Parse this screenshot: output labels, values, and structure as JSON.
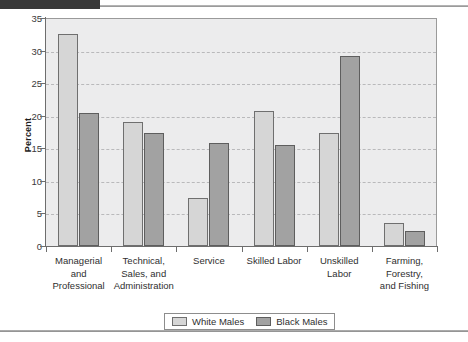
{
  "chart_data": {
    "type": "bar",
    "title": "",
    "xlabel": "",
    "ylabel": "Percent",
    "ylim": [
      0,
      35
    ],
    "yticks": [
      0,
      5,
      10,
      15,
      20,
      25,
      30,
      35
    ],
    "grid": true,
    "legend_position": "bottom",
    "categories": [
      "Managerial and Professional",
      "Technical, Sales, and Administration",
      "Service",
      "Skilled Labor",
      "Unskilled Labor",
      "Farming, Forestry, and Fishing"
    ],
    "category_lines": [
      [
        "Managerial",
        "and",
        "Professional"
      ],
      [
        "Technical,",
        "Sales, and",
        "Administration"
      ],
      [
        "Service"
      ],
      [
        "Skilled Labor"
      ],
      [
        "Unskilled",
        "Labor"
      ],
      [
        "Farming,",
        "Forestry,",
        "and Fishing"
      ]
    ],
    "series": [
      {
        "name": "White Males",
        "color": "#d6d6d6",
        "values": [
          32.5,
          19.1,
          7.3,
          20.8,
          17.3,
          3.6
        ]
      },
      {
        "name": "Black Males",
        "color": "#a2a2a2",
        "values": [
          20.4,
          17.4,
          15.8,
          15.5,
          29.1,
          2.3
        ]
      }
    ]
  },
  "legend": {
    "items": [
      {
        "label": "White Males",
        "key": "white-males"
      },
      {
        "label": "Black Males",
        "key": "black-males"
      }
    ]
  }
}
